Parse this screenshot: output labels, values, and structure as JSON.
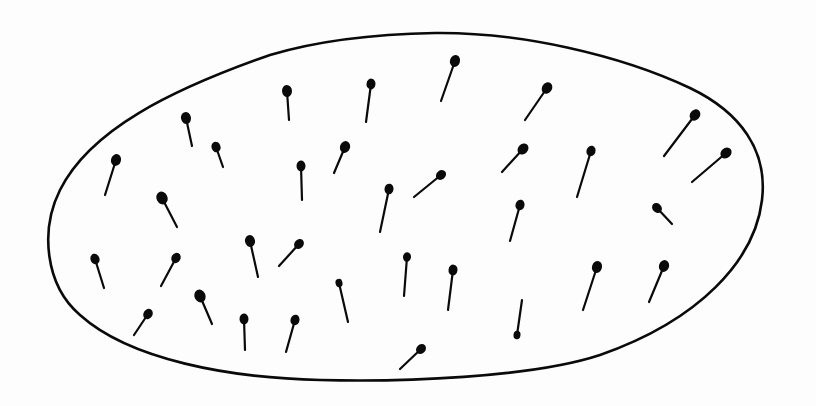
{
  "image": {
    "description": "Hand-drawn ink illustration of an oval/egg-shaped outline containing many small pin-like marks (round heads with short tails), resembling sperm cells or pins scattered inside",
    "colors": {
      "background": "#fdfdfd",
      "ink": "#0a0a0a"
    }
  },
  "pins": [
    {
      "hx": 455,
      "hy": 61,
      "tx": 441,
      "ty": 101,
      "r": 5
    },
    {
      "hx": 547,
      "hy": 88,
      "tx": 525,
      "ty": 120,
      "r": 5
    },
    {
      "hx": 287,
      "hy": 91,
      "tx": 289,
      "ty": 120,
      "r": 5
    },
    {
      "hx": 371,
      "hy": 84,
      "tx": 366,
      "ty": 122,
      "r": 4.5
    },
    {
      "hx": 186,
      "hy": 118,
      "tx": 192,
      "ty": 146,
      "r": 5
    },
    {
      "hx": 216,
      "hy": 147,
      "tx": 223,
      "ty": 167,
      "r": 4.5
    },
    {
      "hx": 116,
      "hy": 160,
      "tx": 105,
      "ty": 195,
      "r": 5
    },
    {
      "hx": 301,
      "hy": 166,
      "tx": 302,
      "ty": 200,
      "r": 4.5
    },
    {
      "hx": 345,
      "hy": 147,
      "tx": 334,
      "ty": 173,
      "r": 5
    },
    {
      "hx": 523,
      "hy": 149,
      "tx": 502,
      "ty": 172,
      "r": 5
    },
    {
      "hx": 591,
      "hy": 151,
      "tx": 577,
      "ty": 197,
      "r": 4.5
    },
    {
      "hx": 695,
      "hy": 115,
      "tx": 664,
      "ty": 156,
      "r": 5
    },
    {
      "hx": 726,
      "hy": 153,
      "tx": 692,
      "ty": 182,
      "r": 5
    },
    {
      "hx": 162,
      "hy": 198,
      "tx": 177,
      "ty": 227,
      "r": 5.5
    },
    {
      "hx": 389,
      "hy": 189,
      "tx": 380,
      "ty": 232,
      "r": 4.5
    },
    {
      "hx": 441,
      "hy": 175,
      "tx": 414,
      "ty": 197,
      "r": 4.5
    },
    {
      "hx": 520,
      "hy": 205,
      "tx": 510,
      "ty": 241,
      "r": 4.5
    },
    {
      "hx": 657,
      "hy": 208,
      "tx": 672,
      "ty": 224,
      "r": 4.5
    },
    {
      "hx": 95,
      "hy": 259,
      "tx": 104,
      "ty": 288,
      "r": 4.5
    },
    {
      "hx": 176,
      "hy": 258,
      "tx": 161,
      "ty": 286,
      "r": 4.5
    },
    {
      "hx": 250,
      "hy": 241,
      "tx": 258,
      "ty": 277,
      "r": 5
    },
    {
      "hx": 299,
      "hy": 244,
      "tx": 279,
      "ty": 266,
      "r": 4.5
    },
    {
      "hx": 407,
      "hy": 257,
      "tx": 404,
      "ty": 296,
      "r": 4
    },
    {
      "hx": 453,
      "hy": 270,
      "tx": 448,
      "ty": 310,
      "r": 4.5
    },
    {
      "hx": 597,
      "hy": 267,
      "tx": 583,
      "ty": 310,
      "r": 5
    },
    {
      "hx": 664,
      "hy": 266,
      "tx": 649,
      "ty": 302,
      "r": 5
    },
    {
      "hx": 200,
      "hy": 296,
      "tx": 212,
      "ty": 324,
      "r": 5.5
    },
    {
      "hx": 148,
      "hy": 314,
      "tx": 134,
      "ty": 335,
      "r": 4.5
    },
    {
      "hx": 244,
      "hy": 319,
      "tx": 245,
      "ty": 350,
      "r": 4.5
    },
    {
      "hx": 295,
      "hy": 320,
      "tx": 286,
      "ty": 352,
      "r": 4.5
    },
    {
      "hx": 339,
      "hy": 283,
      "tx": 348,
      "ty": 322,
      "r": 3.5
    },
    {
      "hx": 517,
      "hy": 335,
      "tx": 522,
      "ty": 300,
      "r": 3.5
    },
    {
      "hx": 421,
      "hy": 349,
      "tx": 400,
      "ty": 369,
      "r": 4.5
    }
  ]
}
